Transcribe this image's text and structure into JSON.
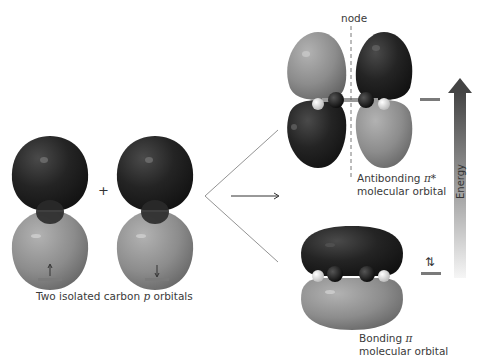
{
  "labels": {
    "isolated": "Two isolated carbon",
    "isolated_p": "p",
    "isolated_tail": "orbitals",
    "node": "node",
    "antibonding_line1": "Antibonding",
    "antibonding_symbol": "π*",
    "antibonding_line2": "molecular orbital",
    "bonding_line1": "Bonding",
    "bonding_symbol": "π",
    "bonding_line2": "molecular orbital",
    "energy": "Energy",
    "plus": "+",
    "electron_up": "↑",
    "electron_down": "↓",
    "electron_pair": "⇅"
  },
  "colors": {
    "dark_lobe": "#1e1e1e",
    "light_lobe": "#8a8a8a",
    "hydrogen": "#e8e8e8",
    "level_bar": "#7a7a7a",
    "arrow_top": "#4a4a4a",
    "arrow_bottom": "#f4f4f4"
  }
}
